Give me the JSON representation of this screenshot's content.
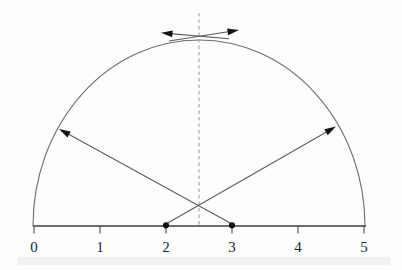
{
  "figure": {
    "colors": {
      "background": "#fdfdfc",
      "arc": "#6e6e6e",
      "line": "#5c5c5c",
      "axis": "#3d3d3d",
      "dash": "#a3a3a3",
      "marker": "#141414",
      "label": "#262626",
      "scan_band": "#eceae5"
    },
    "axis": {
      "y": 226,
      "x_start": 33,
      "x_end": 366,
      "tick_len": 7.5,
      "label_baseline_y": 252,
      "ticks": [
        {
          "label": "0",
          "x": 34
        },
        {
          "label": "1",
          "x": 100
        },
        {
          "label": "2",
          "x": 166
        },
        {
          "label": "3",
          "x": 232
        },
        {
          "label": "4",
          "x": 298
        },
        {
          "label": "5",
          "x": 364
        }
      ]
    },
    "arc": {
      "x1": 33,
      "y1": 226,
      "x2": 365,
      "y2": 226,
      "rx": 166,
      "ry": 186
    },
    "dashed_line": {
      "x": 199,
      "y1": 13,
      "y2": 226,
      "dash": "3.5 3"
    },
    "points": [
      {
        "name": "point-2",
        "x": 166,
        "y": 225.3,
        "r": 3.1
      },
      {
        "name": "point-3",
        "x": 232,
        "y": 225.3,
        "r": 3.1
      }
    ],
    "arrows": [
      {
        "name": "chord-arrow-up-right",
        "x1": 166,
        "y1": 224,
        "x2": 336,
        "y2": 126.5
      },
      {
        "name": "chord-arrow-up-left",
        "x1": 232,
        "y1": 224,
        "x2": 59,
        "y2": 129
      },
      {
        "name": "apex-arrow-left",
        "x1": 229,
        "y1": 38.8,
        "x2": 161,
        "y2": 32.8
      },
      {
        "name": "apex-arrow-right",
        "x1": 169,
        "y1": 41,
        "x2": 239,
        "y2": 30
      }
    ],
    "arrow_head": {
      "length": 11.5,
      "half_width": 3.4
    },
    "scan_band": {
      "x": 18,
      "y": 257,
      "width": 372,
      "height": 8,
      "opacity": 0.55
    }
  },
  "chart_data": {
    "type": "diagram",
    "x_axis": {
      "range": [
        0,
        5
      ],
      "tick_labels": [
        "0",
        "1",
        "2",
        "3",
        "4",
        "5"
      ]
    },
    "semicircle": {
      "center_x": 2.5,
      "radius": 2.5,
      "on_axis": true
    },
    "vertical_dashed_line_x": 2.5,
    "marked_points_x": [
      2,
      3
    ],
    "arrows": [
      {
        "from": "point x=2 on axis",
        "to": "upper-right of arc near x=4.55",
        "head": "up-right"
      },
      {
        "from": "point x=3 on axis",
        "to": "upper-left of arc near x=0.45",
        "head": "up-left"
      },
      {
        "at": "arc apex",
        "direction": "left",
        "style": "tangent"
      },
      {
        "at": "arc apex",
        "direction": "right",
        "style": "tangent"
      }
    ]
  }
}
